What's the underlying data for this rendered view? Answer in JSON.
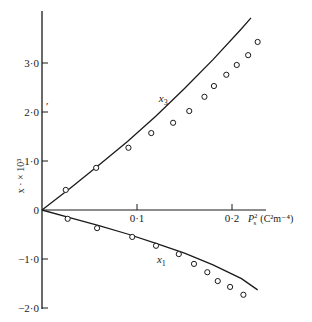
{
  "chart_data": {
    "type": "scatter",
    "title": "",
    "xlabel": "P_s^2 (C^2 m^-4)",
    "xlabel_display": {
      "main": "P",
      "sub": "s",
      "sup": "2",
      "unit": "(C²m⁻⁴)"
    },
    "ylabel": "x · × 10³",
    "xlim": [
      0,
      0.24
    ],
    "ylim": [
      -2.0,
      4.0
    ],
    "grid": false,
    "legend": "inline labels",
    "x_ticks": [
      {
        "value": 0.1,
        "label": "0·1"
      },
      {
        "value": 0.2,
        "label": "0·2"
      }
    ],
    "y_ticks": [
      {
        "value": 3.0,
        "label": "3·0"
      },
      {
        "value": 2.0,
        "label": "2·0"
      },
      {
        "value": 1.0,
        "label": "1·0"
      },
      {
        "value": 0,
        "label": "0"
      },
      {
        "value": -1.0,
        "label": "−1·0"
      },
      {
        "value": -2.0,
        "label": "−2·0"
      }
    ],
    "series": [
      {
        "name": "x3",
        "label": "x",
        "label_sub": "3",
        "label_pos": [
          0.123,
          2.2
        ],
        "points": [
          [
            0.025,
            0.41
          ],
          [
            0.057,
            0.86
          ],
          [
            0.091,
            1.27
          ],
          [
            0.115,
            1.57
          ],
          [
            0.138,
            1.78
          ],
          [
            0.155,
            2.02
          ],
          [
            0.171,
            2.31
          ],
          [
            0.181,
            2.53
          ],
          [
            0.194,
            2.76
          ],
          [
            0.205,
            2.96
          ],
          [
            0.217,
            3.16
          ],
          [
            0.227,
            3.43
          ]
        ],
        "curve": [
          [
            0,
            0
          ],
          [
            0.03,
            0.45
          ],
          [
            0.06,
            0.92
          ],
          [
            0.09,
            1.4
          ],
          [
            0.12,
            1.92
          ],
          [
            0.15,
            2.48
          ],
          [
            0.18,
            3.07
          ],
          [
            0.21,
            3.7
          ],
          [
            0.22,
            3.92
          ]
        ]
      },
      {
        "name": "x1",
        "label": "x",
        "label_sub": "1",
        "label_pos": [
          0.121,
          -1.08
        ],
        "points": [
          [
            0.027,
            -0.18
          ],
          [
            0.058,
            -0.37
          ],
          [
            0.095,
            -0.55
          ],
          [
            0.12,
            -0.73
          ],
          [
            0.144,
            -0.9
          ],
          [
            0.16,
            -1.1
          ],
          [
            0.174,
            -1.27
          ],
          [
            0.185,
            -1.45
          ],
          [
            0.198,
            -1.57
          ],
          [
            0.212,
            -1.73
          ]
        ],
        "curve": [
          [
            0,
            0
          ],
          [
            0.03,
            -0.16
          ],
          [
            0.06,
            -0.32
          ],
          [
            0.09,
            -0.49
          ],
          [
            0.12,
            -0.68
          ],
          [
            0.15,
            -0.88
          ],
          [
            0.18,
            -1.12
          ],
          [
            0.21,
            -1.4
          ],
          [
            0.227,
            -1.63
          ]
        ]
      }
    ]
  },
  "stray_mark": "′"
}
